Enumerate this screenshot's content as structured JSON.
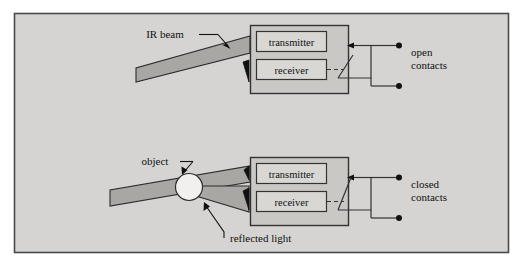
{
  "figure": {
    "background_color": "#d5d4d2",
    "frame_color": "#4a4a4a",
    "beam_fill": "#a8a7a4",
    "beam_stroke": "#2c2c2c",
    "box_fill": "#c9c8c5",
    "box_stroke": "#333333",
    "inner_box_fill": "#d8d7d4",
    "text_color": "#111111"
  },
  "upper_diagram": {
    "name": "no-object-open-contacts",
    "beam_label": "IR beam",
    "sensor": {
      "transmitter_label": "transmitter",
      "receiver_label": "receiver"
    },
    "contacts": {
      "state_label_line1": "open",
      "state_label_line2": "contacts",
      "state": "open"
    }
  },
  "lower_diagram": {
    "name": "object-present-closed-contacts",
    "object_label": "object",
    "reflected_label": "reflected light",
    "sensor": {
      "transmitter_label": "transmitter",
      "receiver_label": "receiver"
    },
    "contacts": {
      "state_label_line1": "closed",
      "state_label_line2": "contacts",
      "state": "closed"
    }
  }
}
